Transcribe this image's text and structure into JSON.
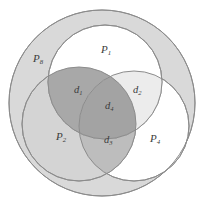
{
  "figure": {
    "type": "venn-diagram",
    "labels": {
      "universe": {
        "base": "P",
        "sub": "8",
        "full": "P8"
      },
      "set1": {
        "base": "P",
        "sub": "1",
        "full": "P1"
      },
      "set2": {
        "base": "P",
        "sub": "2",
        "full": "P2"
      },
      "set4": {
        "base": "P",
        "sub": "4",
        "full": "P4"
      },
      "region1": {
        "base": "d",
        "sub": "1",
        "full": "d1"
      },
      "region2": {
        "base": "d",
        "sub": "2",
        "full": "d2"
      },
      "region3": {
        "base": "d",
        "sub": "3",
        "full": "d3"
      },
      "region4": {
        "base": "d",
        "sub": "4",
        "full": "d4"
      }
    },
    "colors": {
      "background": "#ffffff",
      "outer_fill": "#d9d9d9",
      "set_light_fill": "#ffffff",
      "set_gray_fill": "#d4d4d4",
      "intersection_dark": "#a8a8a8",
      "intersection_mid": "#bdbdbd",
      "intersection_light": "#e6e6e6",
      "stroke": "#8c8c8c",
      "text": "#3b3b3b"
    },
    "geometry": {
      "outer": {
        "cx": 102,
        "cy": 103,
        "r": 93
      },
      "set1": {
        "cx": 105,
        "cy": 82,
        "r": 57
      },
      "set2": {
        "cx": 79,
        "cy": 124,
        "r": 57
      },
      "set4": {
        "cx": 134,
        "cy": 126,
        "r": 55
      }
    }
  }
}
